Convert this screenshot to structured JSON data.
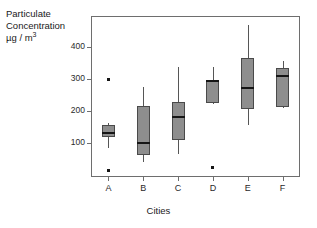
{
  "chart_data": {
    "type": "box",
    "title": "",
    "xlabel": "Cities",
    "ylabel": "Particulate Concentration µg / m3",
    "ylabel_line1": "Particulate",
    "ylabel_line2": "Concentration",
    "ylabel_line3_pre": "µg / m",
    "ylabel_line3_sup": "3",
    "categories": [
      "A",
      "B",
      "C",
      "D",
      "E",
      "F"
    ],
    "ytick_labels": [
      "100",
      "200",
      "300",
      "400"
    ],
    "ytick_values": [
      100,
      200,
      300,
      400
    ],
    "ylim": [
      0,
      500
    ],
    "grid": false,
    "legend": false,
    "series": [
      {
        "name": "A",
        "whisker_low": 85,
        "q1": 120,
        "median": 130,
        "q3": 155,
        "whisker_high": 163,
        "outliers": [
          298,
          15
        ]
      },
      {
        "name": "B",
        "whisker_low": 40,
        "q1": 62,
        "median": 101,
        "q3": 216,
        "whisker_high": 274,
        "outliers": []
      },
      {
        "name": "C",
        "whisker_low": 65,
        "q1": 108,
        "median": 180,
        "q3": 229,
        "whisker_high": 337,
        "outliers": []
      },
      {
        "name": "D",
        "whisker_low": 222,
        "q1": 225,
        "median": 294,
        "q3": 297,
        "whisker_high": 338,
        "outliers": [
          25
        ]
      },
      {
        "name": "E",
        "whisker_low": 156,
        "q1": 206,
        "median": 272,
        "q3": 366,
        "whisker_high": 470,
        "outliers": []
      },
      {
        "name": "F",
        "whisker_low": 209,
        "q1": 212,
        "median": 309,
        "q3": 334,
        "whisker_high": 355,
        "outliers": []
      }
    ]
  },
  "colors": {
    "box_fill": "#8e8e8e",
    "box_stroke": "#4a4a4a",
    "median": "#161616",
    "whisker": "#565656",
    "frame": "#6e6e6e",
    "text": "#1a1a1a",
    "background": "#ffffff"
  }
}
